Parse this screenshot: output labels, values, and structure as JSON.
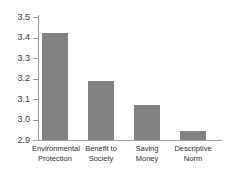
{
  "chart_data": {
    "type": "bar",
    "title": "",
    "subtitle": "",
    "xlabel": "",
    "ylabel": "",
    "categories": [
      "Environmental\nProtection",
      "Benefit to\nSociety",
      "Saving\nMoney",
      "Descriptive\nNorm"
    ],
    "values": [
      3.42,
      3.19,
      3.07,
      2.945
    ],
    "ylim": [
      2.9,
      3.5
    ],
    "yticks": [
      "2.9",
      "3.0",
      "3.1",
      "3.2",
      "3.3",
      "3.4",
      "3.5"
    ],
    "ytick_values": [
      2.9,
      3.0,
      3.1,
      3.2,
      3.3,
      3.4,
      3.5
    ],
    "grid": false,
    "legend": null,
    "legend_position": "none",
    "bar_color": "#828282",
    "axis_color": "#9a9a9a",
    "text_color": "#2e2e2e"
  },
  "axis": {
    "y_tick_labels": [
      {
        "label": "3.5",
        "value": 3.5
      },
      {
        "label": "3.4",
        "value": 3.4
      },
      {
        "label": "3.3",
        "value": 3.3
      },
      {
        "label": "3.2",
        "value": 3.2
      },
      {
        "label": "3.1",
        "value": 3.1
      },
      {
        "label": "3.0",
        "value": 3.0
      },
      {
        "label": "2.9",
        "value": 2.9
      }
    ]
  }
}
